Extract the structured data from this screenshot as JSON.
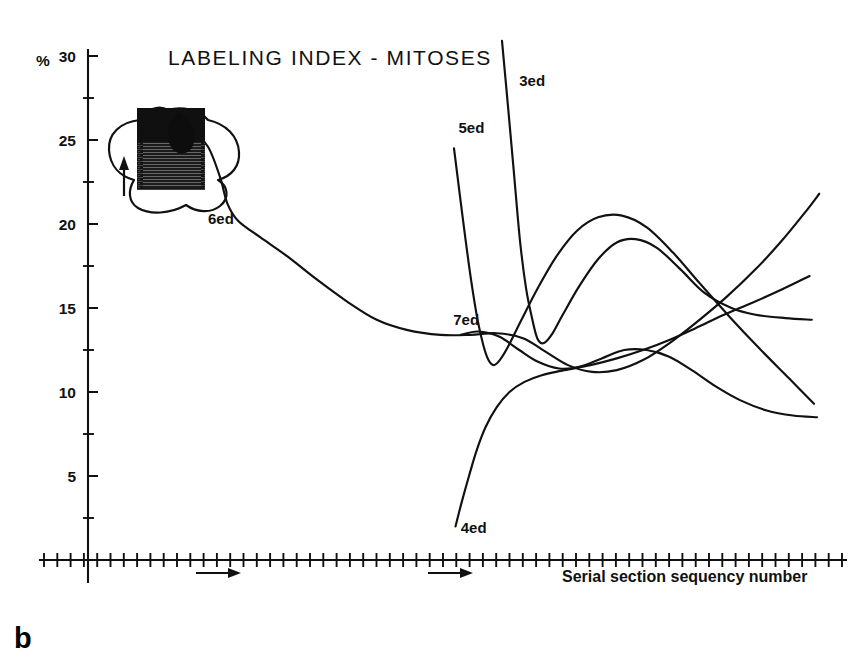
{
  "panel": {
    "label": "b"
  },
  "chart_data": {
    "type": "line",
    "title": "LABELING INDEX - MITOSES",
    "xlabel": "Serial section sequency number",
    "ylabel": "%",
    "ylim": [
      0,
      30
    ],
    "xlim": [
      0,
      60
    ],
    "grid": false,
    "legend_position": "inline-curve-labels",
    "y_ticks_major": [
      5,
      10,
      15,
      20,
      25,
      30
    ],
    "y_tick_labels": [
      "5",
      "10",
      "15",
      "20",
      "25",
      "30"
    ],
    "y_minor_tick_interval": 2.5,
    "x_tick_count": 60,
    "x_tick_labels": [],
    "annotations": [
      {
        "name": "flow-arrow-1",
        "text": "→",
        "x_frac": 0.27,
        "y_value": -2.2
      },
      {
        "name": "flow-arrow-2",
        "text": "→",
        "x_frac": 0.545,
        "y_value": -2.2
      },
      {
        "name": "inset-arrow",
        "text": "↑",
        "x_frac": 0.145,
        "y_value": 22.0
      }
    ],
    "inset": {
      "name": "specimen-thumbnail",
      "description": "shaded tissue block with outline loop and orientation arrow"
    },
    "series": [
      {
        "name": "3ed",
        "label": "3ed",
        "label_x_frac": 0.575,
        "label_y_value": 28.2,
        "points": [
          {
            "x": 0.552,
            "y": 30.9
          },
          {
            "x": 0.56,
            "y": 27.0
          },
          {
            "x": 0.568,
            "y": 23.0
          },
          {
            "x": 0.576,
            "y": 19.0
          },
          {
            "x": 0.584,
            "y": 16.2
          },
          {
            "x": 0.592,
            "y": 14.4
          },
          {
            "x": 0.599,
            "y": 13.2
          },
          {
            "x": 0.607,
            "y": 12.9
          },
          {
            "x": 0.618,
            "y": 13.4
          },
          {
            "x": 0.633,
            "y": 14.6
          },
          {
            "x": 0.655,
            "y": 16.3
          },
          {
            "x": 0.68,
            "y": 17.9
          },
          {
            "x": 0.705,
            "y": 18.9
          },
          {
            "x": 0.73,
            "y": 19.1
          },
          {
            "x": 0.758,
            "y": 18.6
          },
          {
            "x": 0.79,
            "y": 17.3
          },
          {
            "x": 0.822,
            "y": 15.9
          },
          {
            "x": 0.858,
            "y": 15.0
          },
          {
            "x": 0.89,
            "y": 14.6
          },
          {
            "x": 0.93,
            "y": 14.4
          },
          {
            "x": 0.965,
            "y": 14.3
          }
        ]
      },
      {
        "name": "5ed",
        "label": "5ed",
        "label_x_frac": 0.494,
        "label_y_value": 25.4,
        "points": [
          {
            "x": 0.488,
            "y": 24.5
          },
          {
            "x": 0.495,
            "y": 22.0
          },
          {
            "x": 0.503,
            "y": 19.2
          },
          {
            "x": 0.511,
            "y": 16.6
          },
          {
            "x": 0.519,
            "y": 14.4
          },
          {
            "x": 0.527,
            "y": 12.8
          },
          {
            "x": 0.534,
            "y": 11.9
          },
          {
            "x": 0.541,
            "y": 11.6
          },
          {
            "x": 0.549,
            "y": 11.9
          },
          {
            "x": 0.56,
            "y": 12.7
          },
          {
            "x": 0.578,
            "y": 14.3
          },
          {
            "x": 0.6,
            "y": 16.2
          },
          {
            "x": 0.625,
            "y": 18.1
          },
          {
            "x": 0.652,
            "y": 19.6
          },
          {
            "x": 0.68,
            "y": 20.4
          },
          {
            "x": 0.712,
            "y": 20.5
          },
          {
            "x": 0.745,
            "y": 19.8
          },
          {
            "x": 0.78,
            "y": 18.3
          },
          {
            "x": 0.815,
            "y": 16.5
          },
          {
            "x": 0.855,
            "y": 14.5
          },
          {
            "x": 0.895,
            "y": 12.6
          },
          {
            "x": 0.935,
            "y": 10.8
          },
          {
            "x": 0.968,
            "y": 9.3
          }
        ]
      },
      {
        "name": "6ed",
        "label": "6ed",
        "label_x_frac": 0.16,
        "label_y_value": 20.0,
        "points": [
          {
            "x": 0.118,
            "y": 23.0
          },
          {
            "x": 0.128,
            "y": 24.6
          },
          {
            "x": 0.142,
            "y": 25.2
          },
          {
            "x": 0.16,
            "y": 24.6
          },
          {
            "x": 0.176,
            "y": 22.8
          },
          {
            "x": 0.186,
            "y": 21.2
          },
          {
            "x": 0.2,
            "y": 20.2
          },
          {
            "x": 0.23,
            "y": 19.2
          },
          {
            "x": 0.265,
            "y": 18.1
          },
          {
            "x": 0.305,
            "y": 16.7
          },
          {
            "x": 0.345,
            "y": 15.4
          },
          {
            "x": 0.385,
            "y": 14.3
          },
          {
            "x": 0.425,
            "y": 13.7
          },
          {
            "x": 0.47,
            "y": 13.4
          },
          {
            "x": 0.51,
            "y": 13.4
          },
          {
            "x": 0.545,
            "y": 13.5
          },
          {
            "x": 0.58,
            "y": 13.2
          },
          {
            "x": 0.61,
            "y": 12.4
          },
          {
            "x": 0.64,
            "y": 11.6
          },
          {
            "x": 0.672,
            "y": 11.2
          },
          {
            "x": 0.705,
            "y": 11.3
          },
          {
            "x": 0.74,
            "y": 11.9
          },
          {
            "x": 0.775,
            "y": 12.9
          },
          {
            "x": 0.81,
            "y": 14.1
          },
          {
            "x": 0.85,
            "y": 15.6
          },
          {
            "x": 0.89,
            "y": 17.3
          },
          {
            "x": 0.925,
            "y": 19.0
          },
          {
            "x": 0.958,
            "y": 20.8
          },
          {
            "x": 0.975,
            "y": 21.8
          }
        ]
      },
      {
        "name": "7ed",
        "label": "7ed",
        "label_x_frac": 0.487,
        "label_y_value": 14.0,
        "points": [
          {
            "x": 0.497,
            "y": 13.4
          },
          {
            "x": 0.52,
            "y": 13.6
          },
          {
            "x": 0.548,
            "y": 13.3
          },
          {
            "x": 0.575,
            "y": 12.5
          },
          {
            "x": 0.6,
            "y": 11.8
          },
          {
            "x": 0.628,
            "y": 11.4
          },
          {
            "x": 0.655,
            "y": 11.5
          },
          {
            "x": 0.685,
            "y": 12.0
          },
          {
            "x": 0.715,
            "y": 12.5
          },
          {
            "x": 0.745,
            "y": 12.5
          },
          {
            "x": 0.775,
            "y": 12.1
          },
          {
            "x": 0.805,
            "y": 11.3
          },
          {
            "x": 0.838,
            "y": 10.3
          },
          {
            "x": 0.87,
            "y": 9.5
          },
          {
            "x": 0.905,
            "y": 8.9
          },
          {
            "x": 0.94,
            "y": 8.6
          },
          {
            "x": 0.972,
            "y": 8.5
          }
        ]
      },
      {
        "name": "4ed",
        "label": "4ed",
        "label_x_frac": 0.497,
        "label_y_value": 1.6,
        "points": [
          {
            "x": 0.49,
            "y": 2.0
          },
          {
            "x": 0.498,
            "y": 3.4
          },
          {
            "x": 0.508,
            "y": 5.0
          },
          {
            "x": 0.518,
            "y": 6.5
          },
          {
            "x": 0.53,
            "y": 7.9
          },
          {
            "x": 0.545,
            "y": 9.1
          },
          {
            "x": 0.562,
            "y": 10.0
          },
          {
            "x": 0.582,
            "y": 10.6
          },
          {
            "x": 0.605,
            "y": 11.0
          },
          {
            "x": 0.635,
            "y": 11.3
          },
          {
            "x": 0.67,
            "y": 11.6
          },
          {
            "x": 0.705,
            "y": 12.0
          },
          {
            "x": 0.74,
            "y": 12.5
          },
          {
            "x": 0.775,
            "y": 13.1
          },
          {
            "x": 0.81,
            "y": 13.8
          },
          {
            "x": 0.848,
            "y": 14.6
          },
          {
            "x": 0.885,
            "y": 15.3
          },
          {
            "x": 0.925,
            "y": 16.1
          },
          {
            "x": 0.962,
            "y": 16.9
          }
        ]
      }
    ]
  }
}
